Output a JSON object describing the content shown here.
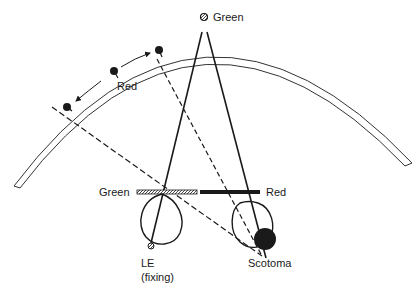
{
  "labels": {
    "green_top": "Green",
    "red_arc": "Red",
    "green_filter": "Green",
    "red_filter": "Red",
    "le_line1": "LE",
    "le_line2": "(fixing)",
    "scotoma": "Scotoma"
  },
  "colors": {
    "ink": "#1a1a1a",
    "background": "#ffffff"
  }
}
